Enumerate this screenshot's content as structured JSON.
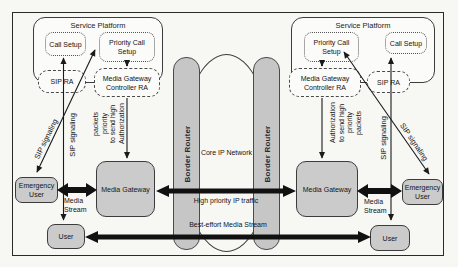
{
  "colors": {
    "box_fill": "#cbcbcb",
    "router_fill": "#c6c6c6",
    "line": "#1a1a1a"
  },
  "platform_left": {
    "title": "Service Platform",
    "call_setup": "Call Setup",
    "priority_call_setup": "Priority Call\nSetup",
    "sip_ra": "SIP RA",
    "media_gateway_controller_ra": "Media Gateway\nController RA"
  },
  "platform_right": {
    "title": "Service Platform",
    "call_setup": "Call Setup",
    "priority_call_setup": "Priority Call\nSetup",
    "sip_ra": "SIP RA",
    "media_gateway_controller_ra": "Media Gateway\nController RA"
  },
  "core_network": {
    "label": "Core IP Network",
    "border_router_left": "Border Router",
    "border_router_right": "Border Router"
  },
  "left_side": {
    "emergency_user": "Emergency\nUser",
    "media_gateway": "Media Gateway",
    "user": "User",
    "media_stream": "Media\nStream",
    "sip_signaling_diagonal": "SIP signaling",
    "sip_signaling_vertical": "SIP signaling",
    "authorization": "Authorization\nto send high\npriority\npackets"
  },
  "right_side": {
    "emergency_user": "Emergency\nUser",
    "media_gateway": "Media Gateway",
    "user": "User",
    "media_stream": "Media\nStream",
    "sip_signaling_diagonal": "SIP signaling",
    "sip_signaling_vertical": "SIP signaling",
    "authorization": "Authorization\nto send high\npriority\npackets"
  },
  "flows": {
    "high_priority": "High priority IP traffic",
    "best_effort": "Best-effort Media Stream"
  }
}
